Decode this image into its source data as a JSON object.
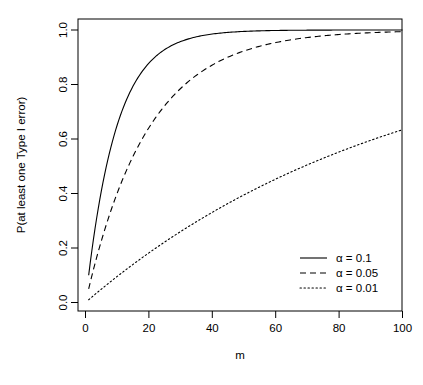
{
  "chart_data": {
    "type": "line",
    "title": "",
    "xlabel": "m",
    "ylabel": "P(at least one Type I error)",
    "xlim": [
      0,
      103
    ],
    "ylim": [
      -0.02,
      1.04
    ],
    "xticks": [
      "0",
      "20",
      "40",
      "60",
      "80",
      "100"
    ],
    "xtick_values": [
      0,
      20,
      40,
      60,
      80,
      100
    ],
    "yticks": [
      "0.0",
      "0.2",
      "0.4",
      "0.6",
      "0.8",
      "1.0"
    ],
    "ytick_values": [
      0.0,
      0.2,
      0.4,
      0.6,
      0.8,
      1.0
    ],
    "grid": false,
    "legend_position": "bottom-right",
    "formula": "P = 1 - (1 - alpha)^m",
    "x": [
      1,
      2,
      3,
      4,
      5,
      6,
      7,
      8,
      9,
      10,
      12,
      14,
      16,
      18,
      20,
      25,
      30,
      35,
      40,
      45,
      50,
      55,
      60,
      65,
      70,
      75,
      80,
      85,
      90,
      95,
      100
    ],
    "series": [
      {
        "name": "α = 0.1",
        "alpha": 0.1,
        "linestyle": "solid",
        "color": "#000000",
        "values": [
          0.1,
          0.19,
          0.271,
          0.344,
          0.41,
          0.469,
          0.522,
          0.57,
          0.613,
          0.651,
          0.718,
          0.771,
          0.815,
          0.85,
          0.878,
          0.928,
          0.958,
          0.975,
          0.985,
          0.991,
          0.995,
          0.997,
          0.998,
          0.999,
          0.999,
          1.0,
          1.0,
          1.0,
          1.0,
          1.0,
          1.0
        ]
      },
      {
        "name": "α = 0.05",
        "alpha": 0.05,
        "linestyle": "dashed",
        "color": "#000000",
        "values": [
          0.05,
          0.098,
          0.143,
          0.185,
          0.226,
          0.265,
          0.302,
          0.337,
          0.37,
          0.401,
          0.46,
          0.512,
          0.56,
          0.603,
          0.642,
          0.723,
          0.785,
          0.834,
          0.871,
          0.901,
          0.923,
          0.94,
          0.954,
          0.965,
          0.972,
          0.979,
          0.983,
          0.987,
          0.99,
          0.992,
          0.994
        ]
      },
      {
        "name": "α = 0.01",
        "alpha": 0.01,
        "linestyle": "dotted",
        "color": "#000000",
        "values": [
          0.01,
          0.02,
          0.03,
          0.039,
          0.049,
          0.059,
          0.068,
          0.077,
          0.086,
          0.096,
          0.114,
          0.131,
          0.149,
          0.165,
          0.182,
          0.222,
          0.26,
          0.297,
          0.331,
          0.364,
          0.395,
          0.425,
          0.453,
          0.48,
          0.505,
          0.529,
          0.552,
          0.574,
          0.595,
          0.615,
          0.634
        ]
      }
    ]
  },
  "legend": {
    "entries": [
      {
        "label": "α = 0.1",
        "style": "solid"
      },
      {
        "label": "α = 0.05",
        "style": "dashed"
      },
      {
        "label": "α = 0.01",
        "style": "dotted"
      }
    ]
  },
  "axes": {
    "x_title": "m",
    "y_title": "P(at least one Type I error)"
  }
}
